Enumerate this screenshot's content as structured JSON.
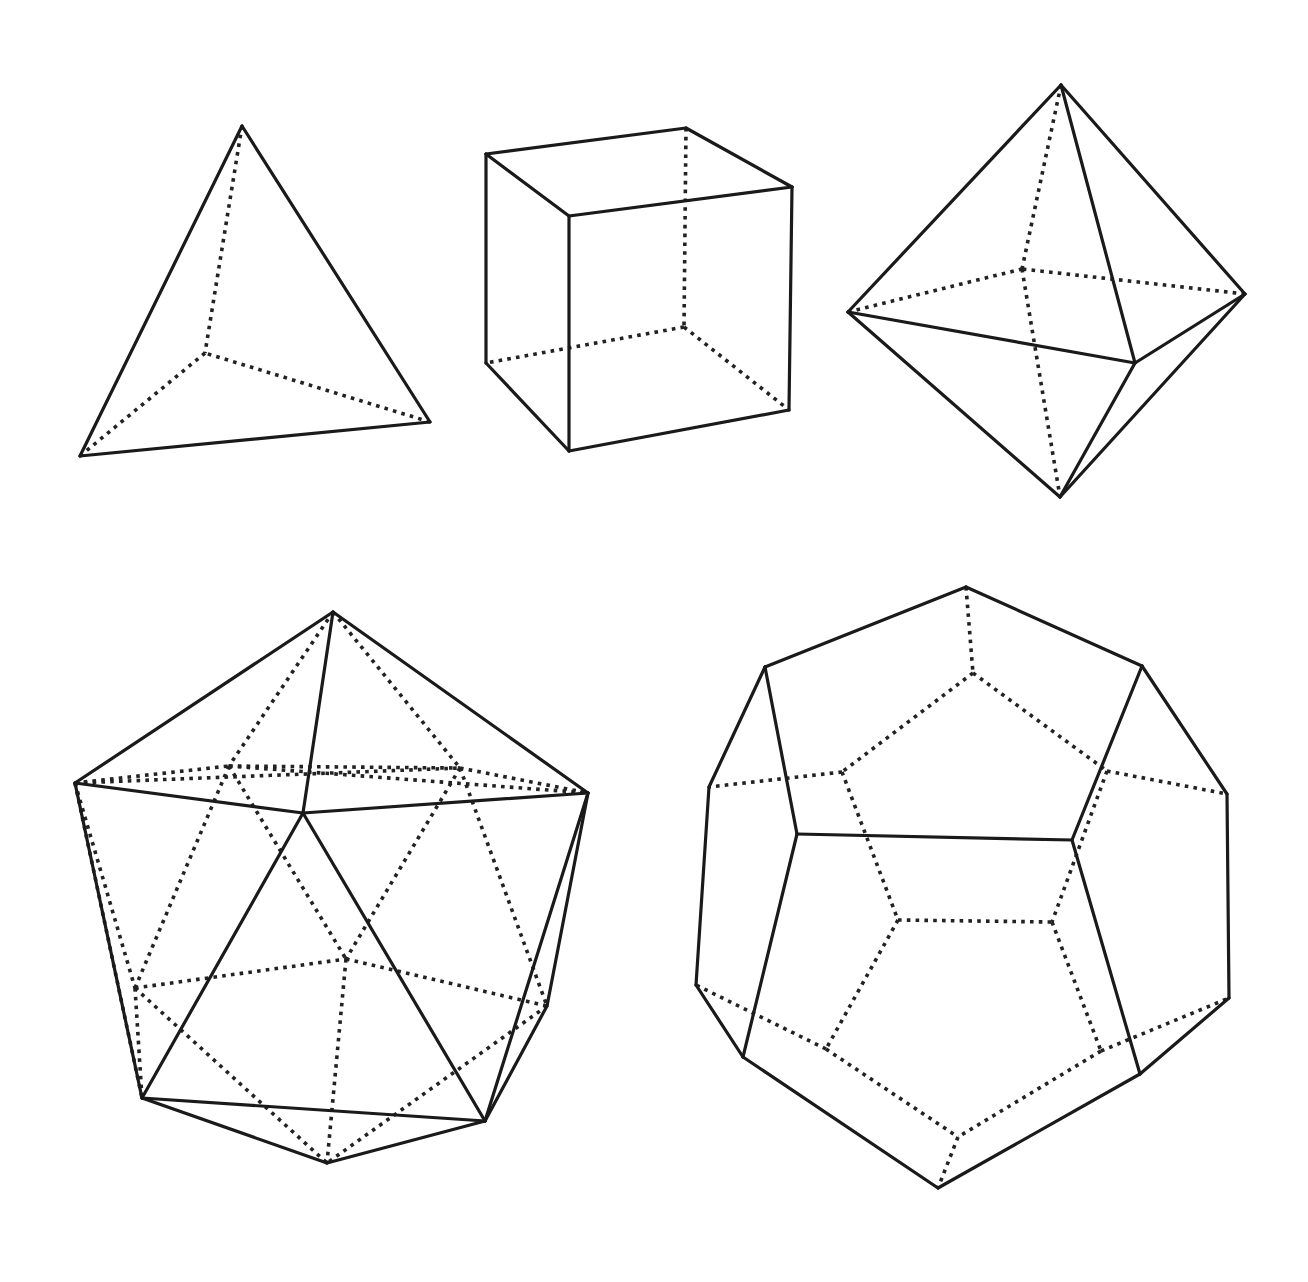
{
  "figure": {
    "width": 1308,
    "height": 1282,
    "background": "#ffffff",
    "stroke_color": "#1a1a1a",
    "legend": {
      "solid": "visible edge",
      "dotted": "hidden edge"
    }
  },
  "solids": [
    {
      "id": "tetrahedron",
      "name": "Tetrahedron",
      "vertices": {
        "top": [
          242,
          126
        ],
        "left": [
          80,
          456
        ],
        "right": [
          430,
          422
        ],
        "back": [
          205,
          353
        ]
      },
      "solid_edges": [
        [
          "top",
          "left"
        ],
        [
          "top",
          "right"
        ],
        [
          "left",
          "right"
        ]
      ],
      "dotted_edges": [
        [
          "top",
          "back"
        ],
        [
          "left",
          "back"
        ],
        [
          "right",
          "back"
        ]
      ]
    },
    {
      "id": "cube",
      "name": "Cube",
      "vertices": {
        "tbl": [
          486,
          154
        ],
        "tbr": [
          686,
          128
        ],
        "tfr": [
          792,
          187
        ],
        "tfl": [
          569,
          216
        ],
        "bbl": [
          486,
          363
        ],
        "bbr": [
          684,
          327
        ],
        "bfr": [
          789,
          410
        ],
        "bfl": [
          569,
          451
        ]
      },
      "solid_edges": [
        [
          "tbl",
          "tbr"
        ],
        [
          "tbr",
          "tfr"
        ],
        [
          "tfr",
          "tfl"
        ],
        [
          "tfl",
          "tbl"
        ],
        [
          "tbl",
          "bbl"
        ],
        [
          "tfl",
          "bfl"
        ],
        [
          "tfr",
          "bfr"
        ],
        [
          "bbl",
          "bfl"
        ],
        [
          "bfl",
          "bfr"
        ]
      ],
      "dotted_edges": [
        [
          "tbr",
          "bbr"
        ],
        [
          "bbr",
          "bbl"
        ],
        [
          "bbr",
          "bfr"
        ]
      ]
    },
    {
      "id": "octahedron",
      "name": "Octahedron",
      "vertices": {
        "top": [
          1061,
          85
        ],
        "left": [
          848,
          312
        ],
        "right": [
          1245,
          294
        ],
        "front": [
          1135,
          363
        ],
        "back": [
          1022,
          269
        ],
        "bottom": [
          1060,
          497
        ]
      },
      "solid_edges": [
        [
          "top",
          "left"
        ],
        [
          "top",
          "right"
        ],
        [
          "top",
          "front"
        ],
        [
          "left",
          "front"
        ],
        [
          "front",
          "right"
        ],
        [
          "left",
          "bottom"
        ],
        [
          "front",
          "bottom"
        ],
        [
          "right",
          "bottom"
        ]
      ],
      "dotted_edges": [
        [
          "top",
          "back"
        ],
        [
          "left",
          "back"
        ],
        [
          "right",
          "back"
        ],
        [
          "back",
          "bottom"
        ]
      ]
    },
    {
      "id": "icosahedron",
      "name": "Icosahedron",
      "vertices": {
        "top": [
          333,
          612
        ],
        "left": [
          75,
          783
        ],
        "center": [
          303,
          813
        ],
        "right": [
          588,
          793
        ],
        "bl": [
          142,
          1098
        ],
        "br": [
          485,
          1121
        ],
        "bottom": [
          327,
          1163
        ],
        "rr": [
          547,
          1006
        ],
        "hul": [
          229,
          766
        ],
        "hur": [
          460,
          768
        ],
        "hc": [
          346,
          959
        ],
        "hl": [
          135,
          988
        ]
      },
      "solid_edges": [
        [
          "top",
          "left"
        ],
        [
          "top",
          "right"
        ],
        [
          "top",
          "center"
        ],
        [
          "left",
          "center"
        ],
        [
          "center",
          "right"
        ],
        [
          "left",
          "bl"
        ],
        [
          "center",
          "bl"
        ],
        [
          "center",
          "br"
        ],
        [
          "bl",
          "br"
        ],
        [
          "bl",
          "bottom"
        ],
        [
          "br",
          "bottom"
        ],
        [
          "right",
          "br"
        ],
        [
          "right",
          "rr"
        ],
        [
          "rr",
          "br"
        ]
      ],
      "dotted_edges": [
        [
          "top",
          "hul"
        ],
        [
          "top",
          "hur"
        ],
        [
          "left",
          "hul"
        ],
        [
          "left",
          "hur"
        ],
        [
          "left",
          "hl"
        ],
        [
          "hul",
          "hur"
        ],
        [
          "hul",
          "right"
        ],
        [
          "hur",
          "right"
        ],
        [
          "hul",
          "hl"
        ],
        [
          "hul",
          "hc"
        ],
        [
          "hur",
          "hc"
        ],
        [
          "hur",
          "rr"
        ],
        [
          "hl",
          "hc"
        ],
        [
          "hc",
          "rr"
        ],
        [
          "hl",
          "bl"
        ],
        [
          "hl",
          "bottom"
        ],
        [
          "hc",
          "bottom"
        ],
        [
          "rr",
          "bottom"
        ],
        [
          "left",
          "bl"
        ]
      ]
    },
    {
      "id": "dodecahedron",
      "name": "Dodecahedron",
      "vertices": {
        "top": [
          966,
          587
        ],
        "ur": [
          1142,
          666
        ],
        "r": [
          1227,
          794
        ],
        "r2": [
          1229,
          998
        ],
        "lr": [
          1140,
          1074
        ],
        "bottom": [
          938,
          1188
        ],
        "ll": [
          743,
          1057
        ],
        "l2": [
          696,
          985
        ],
        "l": [
          709,
          787
        ],
        "ul": [
          765,
          667
        ],
        "fa": [
          797,
          834
        ],
        "fb": [
          1072,
          840
        ],
        "h1": [
          973,
          673
        ],
        "h2": [
          842,
          772
        ],
        "h3": [
          1107,
          771
        ],
        "h4": [
          898,
          920
        ],
        "h5": [
          1052,
          922
        ],
        "h6": [
          826,
          1049
        ],
        "h7": [
          1101,
          1051
        ],
        "h8": [
          958,
          1137
        ]
      },
      "solid_edges": [
        [
          "top",
          "ur"
        ],
        [
          "ur",
          "r"
        ],
        [
          "r",
          "r2"
        ],
        [
          "r2",
          "lr"
        ],
        [
          "lr",
          "bottom"
        ],
        [
          "bottom",
          "ll"
        ],
        [
          "ll",
          "l2"
        ],
        [
          "l2",
          "l"
        ],
        [
          "l",
          "ul"
        ],
        [
          "ul",
          "top"
        ],
        [
          "ul",
          "fa"
        ],
        [
          "ur",
          "fb"
        ],
        [
          "fa",
          "fb"
        ],
        [
          "fa",
          "ll"
        ],
        [
          "fb",
          "lr"
        ]
      ],
      "dotted_edges": [
        [
          "top",
          "h1"
        ],
        [
          "h1",
          "h2"
        ],
        [
          "h1",
          "h3"
        ],
        [
          "h2",
          "l"
        ],
        [
          "h2",
          "h4"
        ],
        [
          "h3",
          "r"
        ],
        [
          "h3",
          "h5"
        ],
        [
          "h4",
          "h5"
        ],
        [
          "h4",
          "h6"
        ],
        [
          "h5",
          "h7"
        ],
        [
          "h6",
          "l2"
        ],
        [
          "h6",
          "h8"
        ],
        [
          "h7",
          "r2"
        ],
        [
          "h7",
          "h8"
        ],
        [
          "h8",
          "bottom"
        ]
      ]
    }
  ]
}
